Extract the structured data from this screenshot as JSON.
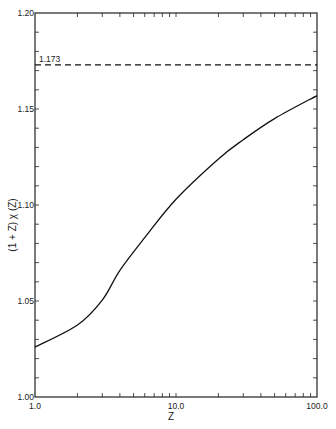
{
  "chart_data": {
    "type": "line",
    "title": "",
    "xlabel": "Z",
    "ylabel": "(1 + Z) χ (Z)",
    "xscale": "log",
    "xlim": [
      1.0,
      100.0
    ],
    "ylim": [
      1.0,
      1.2
    ],
    "grid": false,
    "legend": null,
    "x_tick_labels": [
      "1.0",
      "10.0",
      "100.0"
    ],
    "y_tick_labels": [
      "1.00",
      "1.05",
      "1.10",
      "1.15",
      "1.20"
    ],
    "series": [
      {
        "name": "(1 + Z) χ (Z)",
        "style": "solid",
        "x": [
          1.0,
          2.0,
          3.0,
          4.0,
          6.0,
          10.0,
          20.0,
          30.0,
          50.0,
          100.0
        ],
        "y": [
          1.026,
          1.0375,
          1.0505,
          1.066,
          1.083,
          1.103,
          1.124,
          1.134,
          1.145,
          1.157
        ]
      },
      {
        "name": "asymptote",
        "style": "dashed",
        "x": [
          1.0,
          100.0
        ],
        "y": [
          1.173,
          1.173
        ]
      }
    ],
    "annotations": [
      {
        "text": "1.173",
        "x": 1.0,
        "y": 1.173
      }
    ]
  }
}
